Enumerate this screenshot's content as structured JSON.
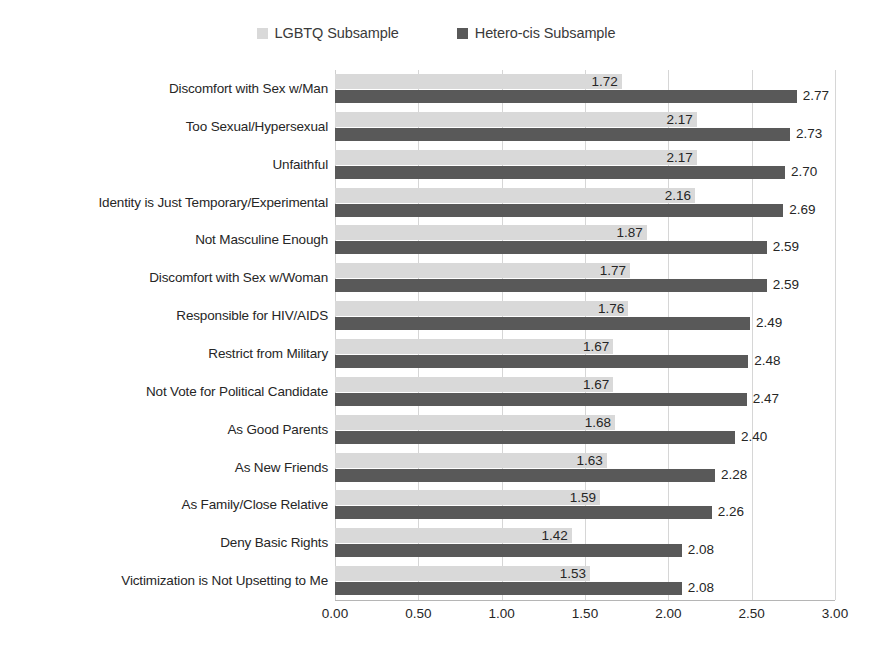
{
  "legend": {
    "position": "top-center",
    "entries": [
      {
        "label": "LGBTQ Subsample",
        "color": "#d9d9d9",
        "icon": "legend-swatch-light"
      },
      {
        "label": "Hetero-cis Subsample",
        "color": "#595959",
        "icon": "legend-swatch-dark"
      }
    ]
  },
  "axis": {
    "ticks": [
      "0.00",
      "0.50",
      "1.00",
      "1.50",
      "2.00",
      "2.50",
      "3.00"
    ]
  },
  "chart_data": {
    "type": "bar",
    "orientation": "horizontal",
    "title": "",
    "subtitle": "",
    "xlabel": "",
    "ylabel": "",
    "xlim": [
      0,
      3
    ],
    "xticks": [
      0,
      0.5,
      1,
      1.5,
      2,
      2.5,
      3
    ],
    "grid": true,
    "legend_position": "top-center",
    "categories": [
      "Discomfort with Sex w/Man",
      "Too Sexual/Hypersexual",
      "Unfaithful",
      "Identity is Just Temporary/Experimental",
      "Not Masculine Enough",
      "Discomfort with Sex w/Woman",
      "Responsible for HIV/AIDS",
      "Restrict from Military",
      "Not Vote for Political Candidate",
      "As Good Parents",
      "As New Friends",
      "As Family/Close Relative",
      "Deny Basic Rights",
      "Victimization is Not Upsetting to Me"
    ],
    "series": [
      {
        "name": "LGBTQ Subsample",
        "color": "#d9d9d9",
        "values": [
          1.72,
          2.17,
          2.17,
          2.16,
          1.87,
          1.77,
          1.76,
          1.67,
          1.67,
          1.68,
          1.63,
          1.59,
          1.42,
          1.53
        ],
        "labels": [
          "1.72",
          "2.17",
          "2.17",
          "2.16",
          "1.87",
          "1.77",
          "1.76",
          "1.67",
          "1.67",
          "1.68",
          "1.63",
          "1.59",
          "1.42",
          "1.53"
        ]
      },
      {
        "name": "Hetero-cis Subsample",
        "color": "#595959",
        "values": [
          2.77,
          2.73,
          2.7,
          2.69,
          2.59,
          2.59,
          2.49,
          2.48,
          2.47,
          2.4,
          2.28,
          2.26,
          2.08,
          2.08
        ],
        "labels": [
          "2.77",
          "2.73",
          "2.70",
          "2.69",
          "2.59",
          "2.59",
          "2.49",
          "2.48",
          "2.47",
          "2.40",
          "2.28",
          "2.26",
          "2.08",
          "2.08"
        ]
      }
    ]
  }
}
